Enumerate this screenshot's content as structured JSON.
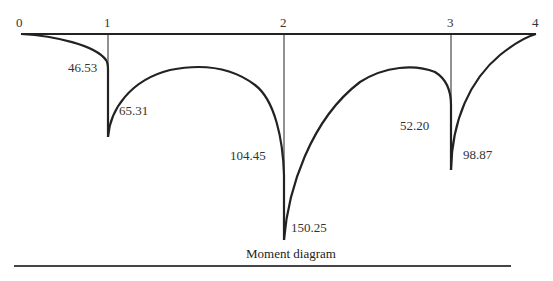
{
  "diagram": {
    "title": "Moment diagram",
    "nodes": [
      {
        "label": "0",
        "x": 21
      },
      {
        "label": "1",
        "x": 108
      },
      {
        "label": "2",
        "x": 284
      },
      {
        "label": "3",
        "x": 451
      },
      {
        "label": "4",
        "x": 536
      }
    ],
    "moment_values": [
      {
        "id": "m1_left",
        "value": "46.53",
        "node": "1",
        "side": "left"
      },
      {
        "id": "m1_right",
        "value": "65.31",
        "node": "1",
        "side": "right"
      },
      {
        "id": "m2_left",
        "value": "104.45",
        "node": "2",
        "side": "left"
      },
      {
        "id": "m2_right",
        "value": "150.25",
        "node": "2",
        "side": "right"
      },
      {
        "id": "m3_left",
        "value": "52.20",
        "node": "3",
        "side": "left"
      },
      {
        "id": "m3_right",
        "value": "98.87",
        "node": "3",
        "side": "right"
      }
    ],
    "colors": {
      "line": "#222222",
      "text": "#333333",
      "background": "#ffffff"
    }
  }
}
